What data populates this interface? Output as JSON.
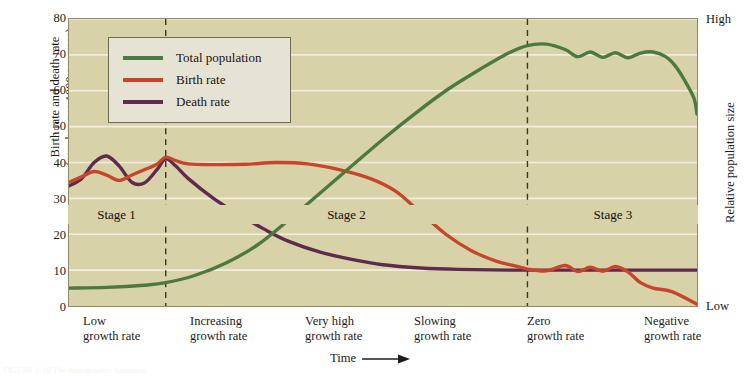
{
  "chart_data": {
    "type": "line",
    "xlabel": "Time",
    "ylabel_left_line1": "Birth rate and death rate",
    "ylabel_left_line2": "(number per 1000 per year)",
    "ylabel_right": "Relative population size",
    "ylim": [
      0,
      80
    ],
    "yticks": [
      0,
      10,
      20,
      30,
      40,
      50,
      60,
      70,
      80
    ],
    "right_axis_ticks": [
      "High",
      "Low"
    ],
    "grid": true,
    "legend_position": "top-left",
    "xlim": [
      0,
      100
    ],
    "stage_boundaries": [
      15.4,
      73.0
    ],
    "series": [
      {
        "name": "Total population",
        "color": "#4c7a3e",
        "points": [
          [
            0,
            5.0
          ],
          [
            6,
            5.2
          ],
          [
            12,
            5.8
          ],
          [
            15.4,
            6.5
          ],
          [
            20,
            8.5
          ],
          [
            25,
            12.0
          ],
          [
            30,
            17.0
          ],
          [
            35,
            24.0
          ],
          [
            40,
            31.5
          ],
          [
            45,
            39.0
          ],
          [
            50,
            46.5
          ],
          [
            55,
            53.5
          ],
          [
            60,
            60.0
          ],
          [
            65,
            65.5
          ],
          [
            70,
            70.5
          ],
          [
            73,
            72.6
          ],
          [
            76,
            73.0
          ],
          [
            79,
            71.5
          ],
          [
            81,
            69.5
          ],
          [
            83,
            70.8
          ],
          [
            85,
            69.3
          ],
          [
            87,
            70.6
          ],
          [
            89,
            69.2
          ],
          [
            91,
            70.5
          ],
          [
            93,
            70.8
          ],
          [
            95,
            69.5
          ],
          [
            96.5,
            67.0
          ],
          [
            98,
            63.0
          ],
          [
            99.5,
            58.0
          ],
          [
            100,
            53.5
          ]
        ]
      },
      {
        "name": "Birth rate",
        "color": "#c8452b",
        "points": [
          [
            0,
            34.5
          ],
          [
            2,
            36.0
          ],
          [
            4,
            37.5
          ],
          [
            6,
            36.5
          ],
          [
            8,
            35.0
          ],
          [
            10,
            36.5
          ],
          [
            12,
            38.0
          ],
          [
            14,
            39.5
          ],
          [
            15.4,
            41.5
          ],
          [
            17,
            40.5
          ],
          [
            19,
            39.6
          ],
          [
            23,
            39.4
          ],
          [
            28,
            39.5
          ],
          [
            33,
            40.0
          ],
          [
            38,
            39.6
          ],
          [
            43,
            38.0
          ],
          [
            48,
            35.5
          ],
          [
            52,
            32.0
          ],
          [
            56,
            26.0
          ],
          [
            60,
            20.0
          ],
          [
            64,
            15.5
          ],
          [
            68,
            12.5
          ],
          [
            71,
            11.2
          ],
          [
            73,
            10.3
          ],
          [
            76,
            9.8
          ],
          [
            79,
            11.3
          ],
          [
            81,
            9.6
          ],
          [
            83,
            10.8
          ],
          [
            85,
            9.7
          ],
          [
            87,
            11.0
          ],
          [
            89,
            9.5
          ],
          [
            91,
            6.5
          ],
          [
            93,
            5.0
          ],
          [
            96,
            4.0
          ],
          [
            100,
            0.5
          ]
        ]
      },
      {
        "name": "Death rate",
        "color": "#5e2a4e",
        "points": [
          [
            0,
            33.5
          ],
          [
            2,
            35.5
          ],
          [
            4,
            40.0
          ],
          [
            6,
            41.8
          ],
          [
            8,
            39.0
          ],
          [
            10,
            34.5
          ],
          [
            12,
            34.3
          ],
          [
            14,
            38.0
          ],
          [
            15.4,
            41.0
          ],
          [
            17,
            39.0
          ],
          [
            19,
            35.5
          ],
          [
            23,
            30.0
          ],
          [
            27,
            25.5
          ],
          [
            31,
            21.5
          ],
          [
            35,
            18.0
          ],
          [
            40,
            15.0
          ],
          [
            45,
            13.0
          ],
          [
            50,
            11.5
          ],
          [
            56,
            10.6
          ],
          [
            62,
            10.2
          ],
          [
            70,
            10.0
          ],
          [
            80,
            10.0
          ],
          [
            90,
            10.0
          ],
          [
            100,
            10.0
          ]
        ]
      }
    ],
    "stages": [
      {
        "label": "Stage 1",
        "start": 0,
        "end": 15.4
      },
      {
        "label": "Stage 2",
        "start": 15.4,
        "end": 73.0
      },
      {
        "label": "Stage 3",
        "start": 73.0,
        "end": 100
      }
    ],
    "growth_rate_labels": [
      {
        "line1": "Low",
        "line2": "growth rate",
        "x_px": 83
      },
      {
        "line1": "Increasing",
        "line2": "growth rate",
        "x_px": 190
      },
      {
        "line1": "Very high",
        "line2": "growth rate",
        "x_px": 305
      },
      {
        "line1": "Slowing",
        "line2": "growth rate",
        "x_px": 414
      },
      {
        "line1": "Zero",
        "line2": "growth rate",
        "x_px": 527
      },
      {
        "line1": "Negative",
        "line2": "growth rate",
        "x_px": 644
      }
    ]
  },
  "legend": {
    "items": [
      {
        "label": "Total population",
        "color": "#4c7a3e"
      },
      {
        "label": "Birth rate",
        "color": "#c8452b"
      },
      {
        "label": "Death rate",
        "color": "#5e2a4e"
      }
    ]
  },
  "axes": {
    "left_title_line1": "Birth rate and death rate",
    "left_title_line2": "(number per 1000 per year)",
    "right_title": "Relative population size",
    "right_top": "High",
    "right_bottom": "Low",
    "time_label": "Time"
  },
  "colors": {
    "plot_background": "#d8d2a8",
    "gridline": "#f2ede0",
    "legend_background": "#e7e3d4",
    "total_population": "#4c7a3e",
    "birth_rate": "#c8452b",
    "death_rate": "#5e2a4e"
  },
  "caption": "FIGURE 1-10  The demographic transition"
}
